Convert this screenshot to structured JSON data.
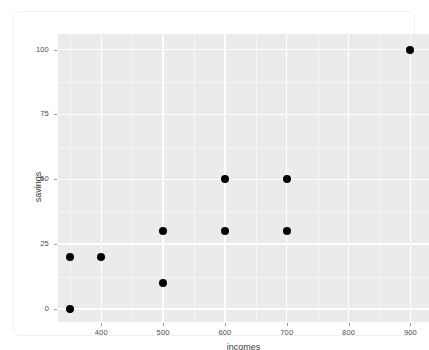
{
  "chart_data": {
    "type": "scatter",
    "title": "",
    "xlabel": "incomes",
    "ylabel": "savings",
    "xlim": [
      330,
      930
    ],
    "ylim": [
      -5,
      106
    ],
    "grid": true,
    "legend": "none",
    "x_ticks": [
      400,
      500,
      600,
      700,
      800,
      900
    ],
    "y_ticks": [
      0,
      25,
      50,
      75,
      100
    ],
    "x_tick_labels": [
      "400",
      "500",
      "600",
      "700",
      "800",
      "900"
    ],
    "y_tick_labels": [
      "0",
      "25",
      "50",
      "75",
      "100"
    ],
    "x_minor_ticks": [
      350,
      450,
      550,
      650,
      750,
      850
    ],
    "y_minor_ticks": [
      12.5,
      37.5,
      62.5,
      87.5
    ],
    "point_color": "#000000",
    "panel_background": "#ebebeb",
    "gridline_color": "#ffffff",
    "points": [
      {
        "x": 350,
        "y": 0
      },
      {
        "x": 350,
        "y": 20
      },
      {
        "x": 400,
        "y": 20
      },
      {
        "x": 500,
        "y": 10
      },
      {
        "x": 500,
        "y": 30
      },
      {
        "x": 600,
        "y": 30
      },
      {
        "x": 600,
        "y": 50
      },
      {
        "x": 700,
        "y": 30
      },
      {
        "x": 700,
        "y": 50
      },
      {
        "x": 900,
        "y": 100
      }
    ]
  }
}
